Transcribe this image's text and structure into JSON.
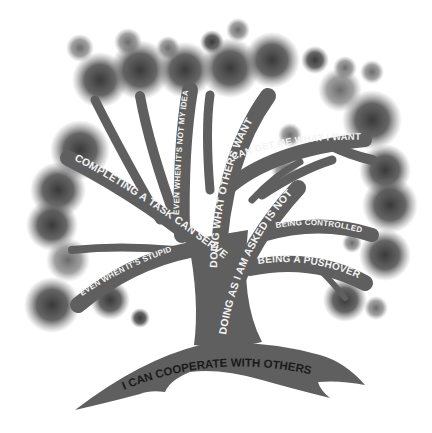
{
  "diagram": {
    "type": "tree-metaphor",
    "colors": {
      "trunk": "#5f5f5f",
      "foliage_dark": "#3e3e3e",
      "foliage_mid": "#6a6a6a",
      "foliage_light": "#8a8a8a",
      "branch_text": "#f4f4f4",
      "root_text": "#1a1a1a",
      "background": "#ffffff"
    },
    "root": {
      "label": "I CAN COOPERATE WITH OTHERS"
    },
    "branches": [
      {
        "id": "completing",
        "label": "COMPLETING A TASK CAN SERVE ME"
      },
      {
        "id": "even-stupid",
        "label": "EVEN WHEN IT'S STUPID"
      },
      {
        "id": "even-not-idea",
        "label": "EVEN WHEN IT'S NOT MY IDEA"
      },
      {
        "id": "doing-what-others",
        "label": "DOING WHAT OTHERS WANT"
      },
      {
        "id": "can-get",
        "label": "CAN GET ME WHAT I WANT"
      },
      {
        "id": "doing-as-asked",
        "label": "DOING AS I AM ASKED IS NOT"
      },
      {
        "id": "being-controlled",
        "label": "BEING CONTROLLED"
      },
      {
        "id": "being-pushover",
        "label": "BEING A PUSHOVER"
      }
    ]
  }
}
